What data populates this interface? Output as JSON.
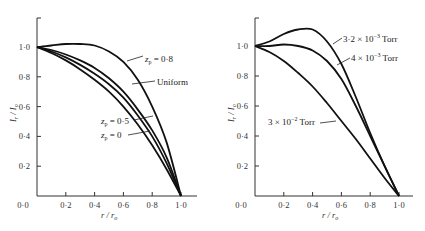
{
  "chart_data": [
    {
      "type": "line",
      "title": "",
      "xlabel": "r / r_o",
      "ylabel": "I_r / I_o",
      "xlim": [
        0,
        1.1
      ],
      "ylim": [
        0,
        1.2
      ],
      "xticks": [
        "0·0",
        "0·2",
        "0·4",
        "0·6",
        "0·8",
        "1·0"
      ],
      "yticks": [
        "0·0",
        "0·2",
        "0·4",
        "0·6",
        "0·8",
        "1·0"
      ],
      "grid": false,
      "x": [
        0,
        0.1,
        0.2,
        0.3,
        0.4,
        0.5,
        0.6,
        0.7,
        0.8,
        0.9,
        1.0
      ],
      "series": [
        {
          "name": "z_p = 0·8",
          "values": [
            1.0,
            1.01,
            1.02,
            1.02,
            1.01,
            0.97,
            0.9,
            0.78,
            0.6,
            0.36,
            0.0
          ]
        },
        {
          "name": "Uniform",
          "values": [
            1.0,
            0.98,
            0.95,
            0.91,
            0.86,
            0.79,
            0.7,
            0.58,
            0.44,
            0.26,
            0.0
          ]
        },
        {
          "name": "z_p = 0·5",
          "values": [
            1.0,
            0.97,
            0.93,
            0.88,
            0.82,
            0.75,
            0.66,
            0.54,
            0.4,
            0.22,
            0.0
          ]
        },
        {
          "name": "z_p = 0",
          "values": [
            1.0,
            0.96,
            0.91,
            0.85,
            0.78,
            0.7,
            0.6,
            0.48,
            0.34,
            0.18,
            0.0
          ]
        }
      ],
      "annotations": [
        {
          "text": "z_p = 0·8",
          "label_x": 145,
          "label_y": 59,
          "line": [
            127,
            61,
            143,
            56
          ]
        },
        {
          "text": "Uniform",
          "label_x": 157,
          "label_y": 84,
          "line": [
            132,
            84,
            155,
            81
          ]
        },
        {
          "text": "z_p = 0·5",
          "label_x": 101,
          "label_y": 124,
          "line": [
            134,
            120,
            153,
            116
          ]
        },
        {
          "text": "z_p = 0",
          "label_x": 101,
          "label_y": 137,
          "line": [
            128,
            135,
            150,
            131
          ]
        }
      ]
    },
    {
      "type": "line",
      "title": "",
      "xlabel": "r / r_o",
      "ylabel": "I_r / I_o",
      "xlim": [
        0,
        1.1
      ],
      "ylim": [
        0,
        1.2
      ],
      "xticks": [
        "0·0",
        "0·2",
        "0·4",
        "0·6",
        "0·8",
        "1·0"
      ],
      "yticks": [
        "0·0",
        "0·2",
        "0·4",
        "0·6",
        "0·8",
        "1·0"
      ],
      "grid": false,
      "x": [
        0,
        0.1,
        0.2,
        0.3,
        0.4,
        0.5,
        0.6,
        0.7,
        0.8,
        0.9,
        1.0
      ],
      "series": [
        {
          "name": "3·2 × 10⁻³ Torr",
          "values": [
            1.0,
            1.03,
            1.08,
            1.11,
            1.11,
            1.03,
            0.88,
            0.66,
            0.42,
            0.2,
            0.0
          ]
        },
        {
          "name": "4 × 10⁻³ Torr",
          "values": [
            1.0,
            1.0,
            1.01,
            1.0,
            0.97,
            0.9,
            0.78,
            0.6,
            0.4,
            0.2,
            0.0
          ]
        },
        {
          "name": "3 × 10⁻² Torr",
          "values": [
            1.0,
            0.96,
            0.9,
            0.82,
            0.73,
            0.62,
            0.5,
            0.38,
            0.25,
            0.12,
            0.0
          ]
        }
      ],
      "annotations": [
        {
          "text": "3·2 × 10⁻³ Torr",
          "label_x": 343,
          "label_y": 40,
          "line": [
            333,
            44,
            342,
            38
          ]
        },
        {
          "text": "4 × 10⁻³ Torr",
          "label_x": 351,
          "label_y": 60,
          "line": [
            337,
            65,
            350,
            58
          ]
        },
        {
          "text": "3 × 10⁻² Torr",
          "label_x": 268,
          "label_y": 126,
          "line": [
            320,
            123,
            336,
            121
          ]
        }
      ]
    }
  ],
  "labels": {
    "left": {
      "ylabel_main": "I",
      "ylabel_sub_r": "r",
      "ylabel_sep": " / ",
      "ylabel_main2": "I",
      "ylabel_sub_o": "o",
      "xlabel_main": "r",
      "xlabel_sep": " / ",
      "xlabel_main2": "r",
      "xlabel_sub": "o",
      "ann": [
        "z",
        "p",
        " = 0·8",
        "Uniform",
        "z",
        "p",
        " = 0·5",
        "z",
        "p",
        " = 0"
      ]
    },
    "right": {
      "ann1": "3·2 × 10",
      "ann1_exp": "−3",
      "ann1_unit": " Torr",
      "ann2": "4 × 10",
      "ann2_exp": "−3",
      "ann2_unit": " Torr",
      "ann3": "3 × 10",
      "ann3_exp": "−2",
      "ann3_unit": " Torr"
    }
  }
}
